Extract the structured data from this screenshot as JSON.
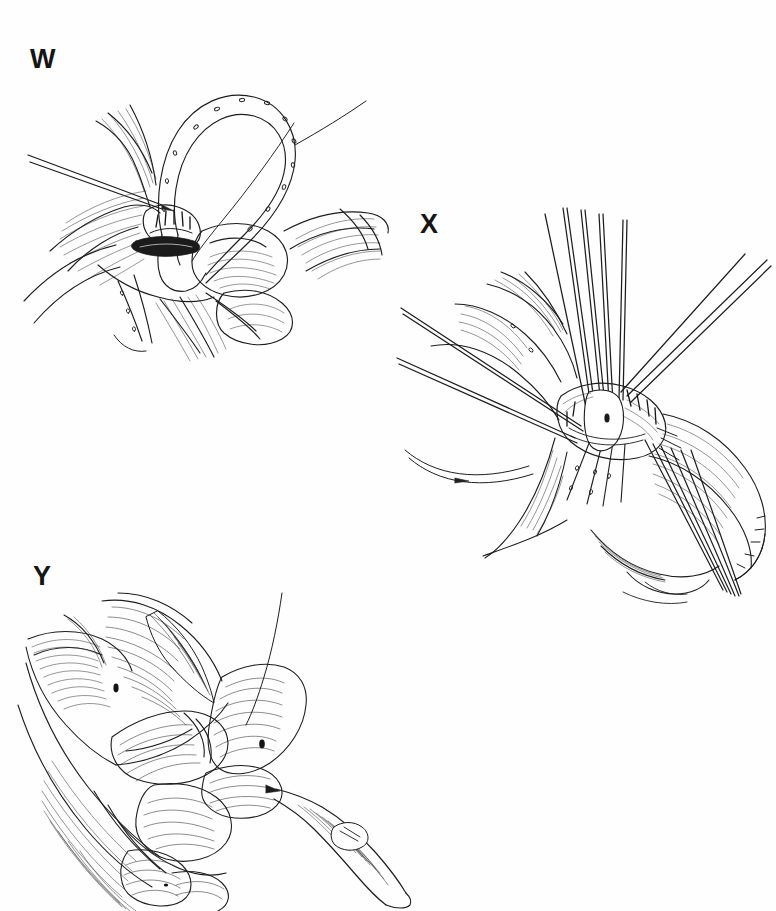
{
  "figure": {
    "type": "surgical-line-illustration",
    "background_color": "#ffffff",
    "ink_color": "#1a1a1a",
    "panel_count": 3,
    "panels": [
      {
        "id": "W",
        "label": "W",
        "label_position": {
          "x": 30,
          "y": 46
        },
        "bounds": {
          "x": 10,
          "y": 35,
          "width": 390,
          "height": 330
        },
        "subject": "surgeon's hand holding a looped tendon graft with running suture dots while a long needle probe enters the tissue flap"
      },
      {
        "id": "X",
        "label": "X",
        "label_position": {
          "x": 420,
          "y": 211
        },
        "bounds": {
          "x": 395,
          "y": 200,
          "width": 381,
          "height": 415
        },
        "subject": "tendon repair site with multiple straight suture needles converging and curved suture threads trailing to the left"
      },
      {
        "id": "Y",
        "label": "Y",
        "label_position": {
          "x": 33,
          "y": 563
        },
        "bounds": {
          "x": 8,
          "y": 555,
          "width": 430,
          "height": 356
        },
        "subject": "hand gripping tissue while a scalpel blade with handle is applied at the fingertip"
      }
    ]
  },
  "canvas": {
    "width": 776,
    "height": 911
  }
}
